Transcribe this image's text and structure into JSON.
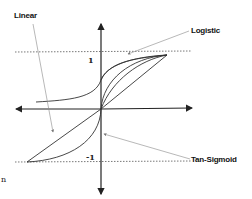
{
  "diagram": {
    "title": "",
    "labels": {
      "linear": "Linear",
      "logistic": "Logistic",
      "tan_sigmoid": "Tan-Sigmoid",
      "y_pos": "1",
      "y_neg": "-1",
      "stray": "n"
    },
    "curves": [
      "Linear",
      "Logistic",
      "Tan-Sigmoid"
    ],
    "axes": {
      "x_arrows": "both",
      "y_arrows": "both"
    },
    "reference_lines": [
      {
        "y": 1,
        "style": "dotted"
      },
      {
        "y": -1,
        "style": "dotted"
      }
    ],
    "colors": {
      "axis": "#222222",
      "curve": "#333333",
      "leader": "#888888",
      "dotted": "#555555"
    }
  }
}
